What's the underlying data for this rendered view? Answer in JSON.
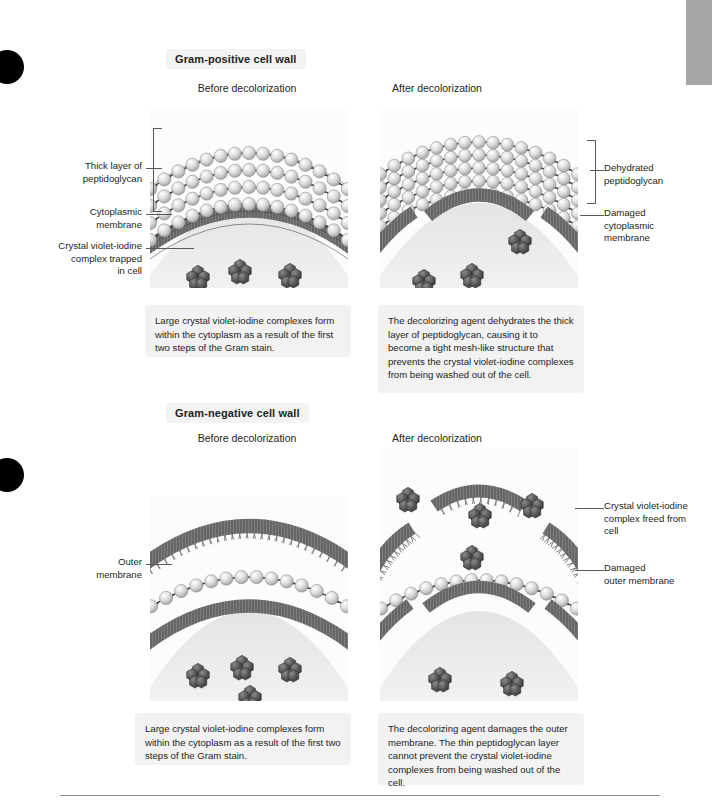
{
  "sections": [
    {
      "id": "gram-positive",
      "title": "Gram-positive cell wall",
      "panels": [
        {
          "id": "gp-before",
          "heading": "Before decolorization",
          "caption": "Large crystal violet-iodine complexes form within the cytoplasm as a result of the first two steps of the Gram stain."
        },
        {
          "id": "gp-after",
          "heading": "After decolorization",
          "caption": "The decolorizing agent dehydrates the thick layer of peptidoglycan, causing it to become a tight mesh-like structure that prevents the crystal violet-iodine complexes from being washed out of the cell."
        }
      ],
      "labels_left": [
        "Thick layer of\npeptidoglycan",
        "Cytoplasmic\nmembrane",
        "Crystal violet-iodine\ncomplex trapped\nin cell"
      ],
      "labels_right": [
        "Dehydrated\npeptidoglycan",
        "Damaged\ncytoplasmic\nmembrane"
      ]
    },
    {
      "id": "gram-negative",
      "title": "Gram-negative cell wall",
      "panels": [
        {
          "id": "gn-before",
          "heading": "Before decolorization",
          "caption": "Large crystal violet-iodine complexes form within the cytoplasm as a result of the first two steps of the Gram stain."
        },
        {
          "id": "gn-after",
          "heading": "After decolorization",
          "caption": "The decolorizing agent damages the outer membrane. The thin peptidoglycan layer cannot prevent the crystal violet-iodine complexes from being washed out of the cell."
        }
      ],
      "labels_left": [
        "Outer\nmembrane"
      ],
      "labels_right": [
        "Crystal violet-iodine\ncomplex freed from\ncell",
        "Damaged\nouter membrane"
      ]
    }
  ],
  "colors": {
    "text": "#231f20",
    "leader": "#58595b",
    "caption_bg": "#f2f2f2",
    "title_bg": "#f3f3f3",
    "scrollbar": "#a6a6a6",
    "peptidoglycan": "#d9d9d9",
    "membrane": "#6e6e6e",
    "complex": "#4a4a4a",
    "cytoplasm": "#ececec"
  },
  "figure": {
    "type": "biology-diagram",
    "structures": [
      "peptidoglycan chains",
      "cytoplasmic membrane",
      "outer membrane",
      "crystal violet-iodine complexes"
    ]
  }
}
